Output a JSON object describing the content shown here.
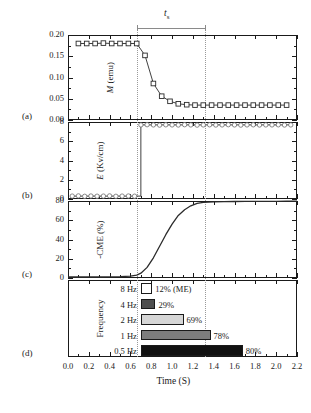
{
  "figure": {
    "xaxis_title": "Time (S)",
    "xticks": [
      "0.0",
      "0.2",
      "0.4",
      "0.6",
      "0.8",
      "1.0",
      "1.2",
      "1.4",
      "1.6",
      "1.8",
      "2.0",
      "2.2"
    ],
    "xlim": [
      0.0,
      2.2
    ],
    "switch_marker": {
      "label": "t",
      "sub": "s",
      "start": 0.66,
      "end": 1.32
    },
    "colors": {
      "axis": "#1a1a1a",
      "guide": "#9a9a9a",
      "curve": "#2b2b2b",
      "bar_white": "#ffffff",
      "bar_dark_gray": "#4f4f4f",
      "bar_light_gray": "#d6d6d6",
      "bar_mid_gray": "#7d7d7d",
      "bar_black": "#111111"
    }
  },
  "panels": [
    {
      "letter": "(a)",
      "ylabel": "M (emu)",
      "ylabel_italic_head": "M",
      "yticks": [
        "0.00",
        "0.05",
        "0.10",
        "0.15",
        "0.20"
      ],
      "ylim": [
        0.0,
        0.2
      ],
      "marker": "open-square",
      "chart_data": {
        "type": "scatter",
        "title": "",
        "xlabel": "Time (S)",
        "ylabel": "M (emu)",
        "ylim": [
          0.0,
          0.2
        ],
        "xlim": [
          0.0,
          2.2
        ],
        "grid": false,
        "x": [
          0.1,
          0.18,
          0.26,
          0.34,
          0.42,
          0.5,
          0.58,
          0.66,
          0.74,
          0.82,
          0.9,
          0.98,
          1.06,
          1.14,
          1.22,
          1.3,
          1.38,
          1.46,
          1.54,
          1.62,
          1.7,
          1.78,
          1.86,
          1.94,
          2.02,
          2.1
        ],
        "y": [
          0.18,
          0.18,
          0.18,
          0.181,
          0.18,
          0.18,
          0.18,
          0.18,
          0.152,
          0.086,
          0.056,
          0.044,
          0.038,
          0.036,
          0.035,
          0.035,
          0.035,
          0.035,
          0.035,
          0.035,
          0.035,
          0.035,
          0.035,
          0.035,
          0.035,
          0.035
        ]
      }
    },
    {
      "letter": "(b)",
      "ylabel": "E (Kv/cm)",
      "ylabel_italic_head": "E",
      "yticks": [
        "0",
        "2",
        "4",
        "6",
        "8"
      ],
      "ylim": [
        0,
        8
      ],
      "marker": "open-circle",
      "chart_data": {
        "type": "scatter",
        "title": "",
        "xlabel": "Time (S)",
        "ylabel": "E (Kv/cm)",
        "ylim": [
          0,
          8
        ],
        "xlim": [
          0.0,
          2.2
        ],
        "grid": false,
        "step_time": 0.7,
        "low_value": 0.3,
        "high_value": 7.7,
        "x": [
          0.04,
          0.1,
          0.16,
          0.22,
          0.28,
          0.34,
          0.4,
          0.46,
          0.52,
          0.58,
          0.64,
          0.7,
          0.76,
          0.82,
          0.88,
          0.94,
          1.0,
          1.06,
          1.12,
          1.18,
          1.24,
          1.3,
          1.36,
          1.42,
          1.48,
          1.54,
          1.6,
          1.66,
          1.72,
          1.78,
          1.84,
          1.9,
          1.96,
          2.02,
          2.08,
          2.14
        ],
        "y": [
          0.3,
          0.32,
          0.28,
          0.31,
          0.29,
          0.3,
          0.32,
          0.28,
          0.3,
          0.31,
          0.29,
          7.7,
          7.72,
          7.7,
          7.68,
          7.71,
          7.7,
          7.69,
          7.72,
          7.7,
          7.68,
          7.7,
          7.71,
          7.69,
          7.7,
          7.72,
          7.7,
          7.68,
          7.7,
          7.71,
          7.69,
          7.7,
          7.7,
          7.71,
          7.69,
          7.7
        ]
      }
    },
    {
      "letter": "(c)",
      "ylabel": "-CME (%)",
      "ylabel_italic_head": "",
      "yticks": [
        "0",
        "20",
        "40",
        "60",
        "80"
      ],
      "ylim": [
        0,
        80
      ],
      "marker": "line",
      "chart_data": {
        "type": "line",
        "title": "",
        "xlabel": "Time (S)",
        "ylabel": "-CME (%)",
        "ylim": [
          0,
          80
        ],
        "xlim": [
          0.0,
          2.2
        ],
        "grid": false,
        "x": [
          0.0,
          0.1,
          0.2,
          0.3,
          0.4,
          0.5,
          0.6,
          0.66,
          0.7,
          0.76,
          0.82,
          0.88,
          0.94,
          1.0,
          1.06,
          1.12,
          1.18,
          1.24,
          1.3,
          1.4,
          1.5,
          1.6,
          1.7,
          1.8,
          1.9,
          2.0,
          2.1,
          2.2
        ],
        "y": [
          1.0,
          1.0,
          1.0,
          1.0,
          1.2,
          1.5,
          2.0,
          3.0,
          5.0,
          11.0,
          21.0,
          33.0,
          45.0,
          56.0,
          65.0,
          71.0,
          75.0,
          77.5,
          78.6,
          79.2,
          79.4,
          79.5,
          79.6,
          79.6,
          79.7,
          79.7,
          79.8,
          79.8
        ]
      }
    },
    {
      "letter": "(d)",
      "ylabel": "Frequency",
      "ylabel_italic_head": "",
      "chart_data": {
        "type": "bar",
        "orientation": "horizontal",
        "title": "",
        "xlabel": "Time (S)",
        "ylabel": "Frequency",
        "xlim": [
          0.0,
          2.2
        ],
        "grid": false,
        "bar_start_time": 0.7,
        "categories": [
          "8 Hz",
          "4 Hz",
          "2 Hz",
          "1 Hz",
          "0.5 Hz"
        ],
        "values": [
          12,
          29,
          69,
          78,
          80
        ],
        "value_labels": [
          "12% (ME)",
          "29%",
          "69%",
          "78%",
          "80%"
        ],
        "end_times": [
          0.81,
          0.84,
          1.11,
          1.37,
          1.68
        ],
        "fills": [
          "#ffffff",
          "#4f4f4f",
          "#d6d6d6",
          "#7d7d7d",
          "#111111"
        ]
      }
    }
  ]
}
